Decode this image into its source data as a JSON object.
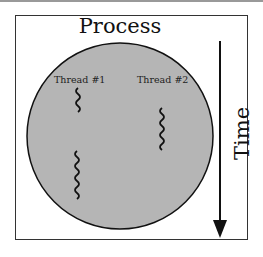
{
  "diagram": {
    "title": "Process",
    "threads": [
      {
        "label": "Thread #1"
      },
      {
        "label": "Thread #2"
      }
    ],
    "time_axis": {
      "label": "Time",
      "direction": "down"
    },
    "colors": {
      "process_fill": "#b5b5b5",
      "stroke": "#111111",
      "background": "#ffffff"
    }
  }
}
